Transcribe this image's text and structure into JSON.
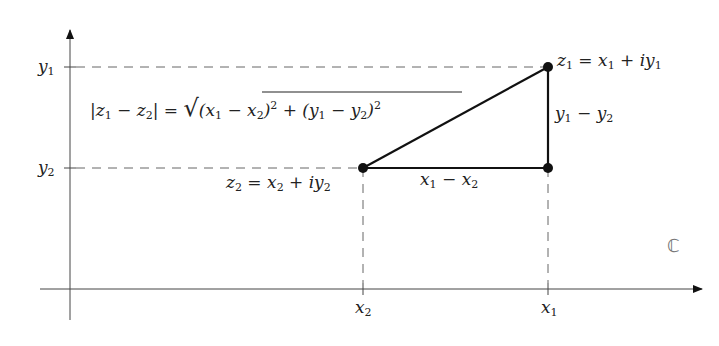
{
  "diagram": {
    "plane_symbol": "ℂ",
    "axes": {
      "y_ticks": [
        {
          "var": "y",
          "sub": "1"
        },
        {
          "var": "y",
          "sub": "2"
        }
      ],
      "x_ticks": [
        {
          "var": "x",
          "sub": "2"
        },
        {
          "var": "x",
          "sub": "1"
        }
      ]
    },
    "points": {
      "z1": {
        "lhs_var": "z",
        "lhs_sub": "1",
        "eq": " = ",
        "a": "x",
        "a_sub": "1",
        "plus": " + ",
        "i": "iy",
        "b_sub": "1"
      },
      "z2": {
        "lhs_var": "z",
        "lhs_sub": "2",
        "eq": " = ",
        "a": "x",
        "a_sub": "2",
        "plus": " + ",
        "i": "iy",
        "b_sub": "2"
      }
    },
    "sides": {
      "horizontal": {
        "a": "x",
        "a_sub": "1",
        "minus": " − ",
        "b": "x",
        "b_sub": "2"
      },
      "vertical": {
        "a": "y",
        "a_sub": "1",
        "minus": " − ",
        "b": "y",
        "b_sub": "2"
      }
    },
    "formula": {
      "left": "|z",
      "s1": "1",
      "mid": " − z",
      "s2": "2",
      "right": "| = ",
      "sqrt": "√",
      "r1": "(x",
      "r1s1": "1",
      "r1m": " − x",
      "r1s2": "2",
      "r1e": ")",
      "sq": "2",
      "plus": " + (y",
      "r2s1": "1",
      "r2m": " − y",
      "r2s2": "2",
      "r2e": ")",
      "sq2": "2"
    }
  }
}
